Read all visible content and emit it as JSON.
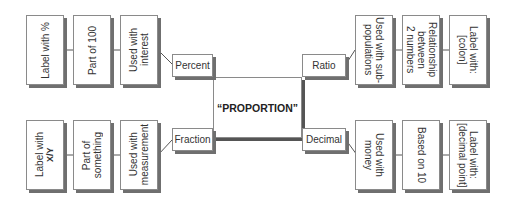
{
  "center": {
    "label": "“PROPORTION”"
  },
  "branches": {
    "percent": {
      "label": "Percent",
      "attributes": [
        "Used with\ninterest",
        "Part of 100",
        "Label with %"
      ]
    },
    "ratio": {
      "label": "Ratio",
      "attributes": [
        "Used with sub-\npopulations",
        "Relationship\nbetween\n2 numbers",
        "Label with:\n[colon]"
      ]
    },
    "fraction": {
      "label": "Fraction",
      "attributes": [
        "Used with\nmeasurement",
        "Part of\nsomething",
        "Label with"
      ],
      "fraction_symbol": "X/Y"
    },
    "decimal": {
      "label": "Decimal",
      "attributes": [
        "Used with\nmoney",
        "Based on 10",
        "Label with:\n[decimal point]"
      ]
    }
  }
}
